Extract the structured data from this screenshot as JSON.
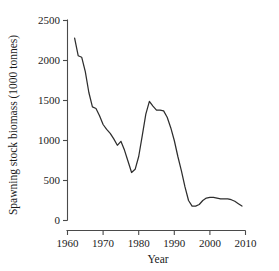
{
  "figure": {
    "background_color": "#ffffff",
    "line_color": "#2e2e2e",
    "axis_color": "#4a4a4a",
    "text_color": "#1b1b1b"
  },
  "chart_data": {
    "type": "line",
    "title": "",
    "xlabel": "Year",
    "ylabel": "Spawning stock biomass (1000 tonnes)",
    "xlim": [
      1960,
      2010
    ],
    "ylim": [
      0,
      2500
    ],
    "xticks": [
      1960,
      1970,
      1980,
      1990,
      2000,
      2010
    ],
    "xtick_labels": [
      "1960",
      "1970",
      "1980",
      "1990",
      "2000",
      "2010"
    ],
    "yticks": [
      0,
      500,
      1000,
      1500,
      2000,
      2500
    ],
    "ytick_labels": [
      "0",
      "500",
      "1000",
      "1500",
      "2000",
      "2500"
    ],
    "grid": false,
    "legend": false,
    "series": [
      {
        "name": "Spawning stock biomass",
        "x": [
          1962,
          1963,
          1964,
          1965,
          1966,
          1967,
          1968,
          1969,
          1970,
          1971,
          1972,
          1973,
          1974,
          1975,
          1976,
          1977,
          1978,
          1979,
          1980,
          1981,
          1982,
          1983,
          1984,
          1985,
          1986,
          1987,
          1988,
          1989,
          1990,
          1991,
          1992,
          1993,
          1994,
          1995,
          1996,
          1997,
          1998,
          1999,
          2000,
          2001,
          2002,
          2003,
          2004,
          2005,
          2006,
          2007,
          2008,
          2009
        ],
        "values": [
          2280,
          2060,
          2040,
          1860,
          1600,
          1420,
          1400,
          1310,
          1200,
          1140,
          1090,
          1020,
          940,
          990,
          880,
          740,
          600,
          640,
          800,
          1060,
          1330,
          1490,
          1430,
          1380,
          1380,
          1370,
          1290,
          1160,
          1000,
          800,
          620,
          420,
          250,
          180,
          180,
          200,
          250,
          280,
          290,
          290,
          280,
          270,
          270,
          270,
          260,
          240,
          210,
          180
        ]
      }
    ]
  },
  "axes": {
    "x_axis_name": "year-axis",
    "y_axis_name": "biomass-axis"
  }
}
